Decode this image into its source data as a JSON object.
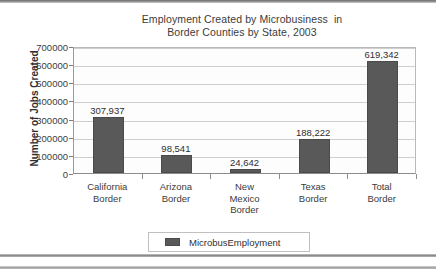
{
  "chart_data": {
    "type": "bar",
    "title": "Employment Created by Microbusiness  in Border Counties by State, 2003",
    "title_lines": [
      "Employment Created by Microbusiness  in",
      "Border Counties by State, 2003"
    ],
    "xlabel": "",
    "ylabel": "Number of Jobs Created",
    "ylim": [
      0,
      700000
    ],
    "ytick_step": 100000,
    "ytick_labels": [
      "700000",
      "600000",
      "500000",
      "400000",
      "300000",
      "200000",
      "100000",
      "0"
    ],
    "ytick_values": [
      700000,
      600000,
      500000,
      400000,
      300000,
      200000,
      100000,
      0
    ],
    "grid": true,
    "legend_position": "bottom",
    "categories": [
      "California Border",
      "Arizona Border",
      "New Mexico Border",
      "Texas Border",
      "Total Border"
    ],
    "category_lines": [
      [
        "California",
        "Border"
      ],
      [
        "Arizona",
        "Border"
      ],
      [
        "New",
        "Mexico",
        "Border"
      ],
      [
        "Texas",
        "Border"
      ],
      [
        "Total",
        "Border"
      ]
    ],
    "series": [
      {
        "name": "MicrobusEmployment",
        "color": "#595959",
        "values": [
          307937,
          98541,
          24642,
          188222,
          619342
        ],
        "value_labels": [
          "307,937",
          "98,541",
          "24,642",
          "188,222",
          "619,342"
        ]
      }
    ]
  },
  "legend": {
    "entries": [
      {
        "label": "MicrobusEmployment",
        "color": "#595959"
      }
    ]
  },
  "colors": {
    "bar_fill": "#595959",
    "bar_stroke": "#4a4a4a",
    "gridline": "#cfcfcf",
    "axis": "#8c8c8c",
    "text": "#2f2f2f",
    "plot_background": "#fdfdfd",
    "page_background": "#ffffff"
  }
}
